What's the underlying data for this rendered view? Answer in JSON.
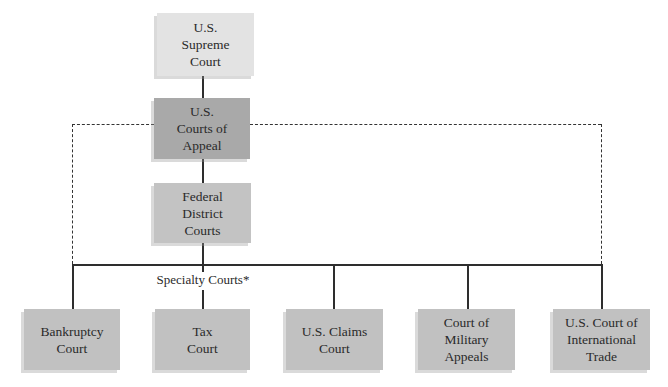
{
  "diagram": {
    "type": "hierarchy",
    "top": {
      "supreme_court": {
        "lines": [
          "U.S.",
          "Supreme",
          "Court"
        ],
        "color": "#e3e3e3"
      },
      "courts_of_appeal": {
        "lines": [
          "U.S.",
          "Courts of",
          "Appeal"
        ],
        "color": "#a9a9a9"
      },
      "district_courts": {
        "lines": [
          "Federal",
          "District",
          "Courts"
        ],
        "color": "#c3c3c3"
      }
    },
    "specialty_label": "Specialty Courts*",
    "specialty_courts": [
      {
        "lines": [
          "Bankruptcy",
          "Court"
        ]
      },
      {
        "lines": [
          "Tax",
          "Court"
        ]
      },
      {
        "lines": [
          "U.S. Claims",
          "Court"
        ]
      },
      {
        "lines": [
          "Court of",
          "Military",
          "Appeals"
        ]
      },
      {
        "lines": [
          "U.S. Court of",
          "International",
          "Trade"
        ]
      }
    ],
    "connector_styles": {
      "solid": "direct appeal path",
      "dashed": "appeal from specialty courts to Courts of Appeal"
    },
    "colors": {
      "line": "#2e2e2e",
      "specialty_box": "#c1c1c1"
    }
  }
}
